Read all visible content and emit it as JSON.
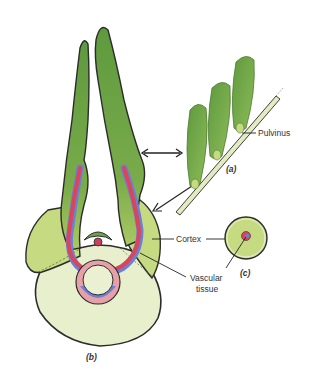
{
  "figure": {
    "panels": {
      "a": "(a)",
      "b": "(b)",
      "c": "(c)"
    },
    "labels": {
      "pulvinus": "Pulvinus",
      "cortex": "Cortex",
      "vascular_line1": "Vascular",
      "vascular_line2": "tissue"
    },
    "colors": {
      "leaf_dark": "#5a9a3c",
      "leaf_mid": "#7fb24e",
      "cortex": "#c4d97e",
      "pith": "#e6eec8",
      "vascular_red": "#d9455a",
      "vascular_blue": "#6c7fd6",
      "outline": "#2c2c2c"
    }
  }
}
